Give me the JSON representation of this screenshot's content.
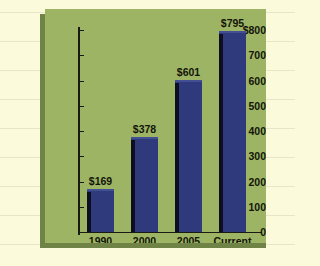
{
  "page": {
    "background_color": "#fbfbdc",
    "rule_color": "#e6e7c8",
    "ruled_line_count": 9
  },
  "panel": {
    "background_color": "#9cb464",
    "shadow_color": "#6f8347"
  },
  "chart_data": {
    "type": "bar",
    "title": "",
    "subtitle": "",
    "xlabel": "",
    "ylabel": "",
    "categories": [
      "1990",
      "2000",
      "2005",
      "Current"
    ],
    "values": [
      169,
      378,
      601,
      795
    ],
    "data_labels": [
      "$169",
      "$378",
      "$601",
      "$795"
    ],
    "ylim": [
      0,
      800
    ],
    "yticks": [
      0,
      100,
      200,
      300,
      400,
      500,
      600,
      700,
      800
    ],
    "ytick_labels": [
      "0",
      "100",
      "200",
      "300",
      "400",
      "500",
      "600",
      "700",
      "$800"
    ],
    "grid": false,
    "legend": null,
    "bar_color": "#2e3a7c",
    "bar_edge_color": "#0d0f20",
    "axis_color": "#1a1a14",
    "text_color": "#141409"
  }
}
